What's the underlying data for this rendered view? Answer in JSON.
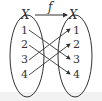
{
  "diagram": {
    "type": "function-mapping",
    "function_label": "f",
    "domain": {
      "label": "X",
      "elements": [
        "1",
        "2",
        "3",
        "4"
      ]
    },
    "codomain": {
      "label": "X",
      "elements": [
        "1",
        "2",
        "3",
        "4"
      ]
    },
    "mappings": [
      {
        "from": "1",
        "to": "3"
      },
      {
        "from": "2",
        "to": "4"
      },
      {
        "from": "3",
        "to": "1"
      },
      {
        "from": "4",
        "to": "2"
      }
    ],
    "colors": {
      "stroke": "#333333",
      "background": "#ffffff"
    }
  }
}
